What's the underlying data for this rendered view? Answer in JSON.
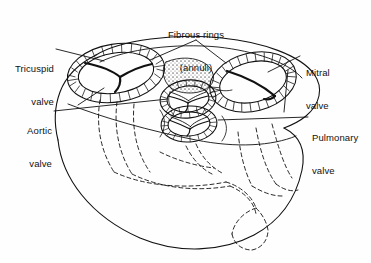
{
  "figure": {
    "background_color": "#fefefe",
    "ink_color": "#111111"
  },
  "labels": {
    "fibrous_rings": {
      "line1": "Fibrous rings",
      "line2": "(annuli)"
    },
    "tricuspid": {
      "line1": "Tricuspid",
      "line2": "valve"
    },
    "aortic": {
      "line1": "Aortic",
      "line2": "valve"
    },
    "mitral": {
      "line1": "Mitral",
      "line2": "valve"
    },
    "pulmonary": {
      "line1": "Pulmonary",
      "line2": "valve"
    }
  },
  "structures": {
    "tricuspid_valve_name": "tricuspid-valve",
    "mitral_valve_name": "mitral-valve",
    "aortic_valve_name": "aortic-valve",
    "pulmonary_valve_name": "pulmonary-valve",
    "fibrous_trigone_name": "fibrous-trigone",
    "heart_outline_name": "heart-silhouette",
    "ventricle_hidden_name": "ventricle-hidden-outline"
  }
}
